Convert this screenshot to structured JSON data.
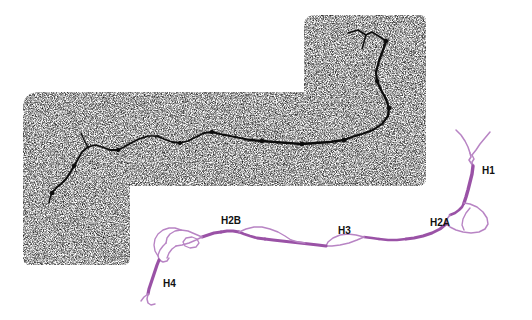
{
  "figure": {
    "background_color": "#ffffff",
    "width": 532,
    "height": 320
  },
  "micrograph": {
    "name": "stippled-electron-micrograph-region",
    "description": "L-shaped grainy black-and-white stippled field",
    "dot_color": "#1a1a1a",
    "shape": "L-shape: upper-right block plus lower-left wide block",
    "bounds": {
      "x": 22,
      "y": 14,
      "width": 404,
      "height": 252
    }
  },
  "dark_filament": {
    "name": "dark-traced-filament",
    "color": "#111111",
    "description": "Dark branching strand traced through the stippled field"
  },
  "fiber": {
    "name": "chromatin-fiber-trace",
    "color_thick": "#9a52a6",
    "color_thin": "#b884c4",
    "description": "Violet traced chromatin fiber with thin loop regions"
  },
  "labels": [
    {
      "id": "H1",
      "text": "H1",
      "x": 482,
      "y": 171
    },
    {
      "id": "H2A",
      "text": "H2A",
      "x": 430,
      "y": 223
    },
    {
      "id": "H3",
      "text": "H3",
      "x": 338,
      "y": 231
    },
    {
      "id": "H2B",
      "text": "H2B",
      "x": 221,
      "y": 221
    },
    {
      "id": "H4",
      "text": "H4",
      "x": 163,
      "y": 284
    }
  ]
}
